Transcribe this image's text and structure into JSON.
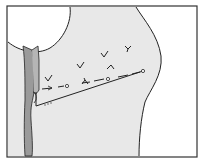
{
  "diagram": {
    "type": "anatomical-illustration",
    "colors": {
      "background": "#ffffff",
      "tissue_fill": "#e8e8e8",
      "band_fill": "#9a9a9a",
      "outline": "#222222",
      "frame": "#333333"
    },
    "markers": {
      "dashed_path_points": [
        [
          40,
          88
        ],
        [
          67,
          86
        ],
        [
          108,
          79
        ],
        [
          143,
          71
        ]
      ],
      "knot_circles": [
        [
          67,
          86
        ],
        [
          108,
          79
        ],
        [
          143,
          71
        ]
      ],
      "check_marks": [
        [
          47,
          80
        ],
        [
          79,
          66
        ],
        [
          104,
          55
        ],
        [
          127,
          49
        ],
        [
          110,
          69
        ],
        [
          85,
          82
        ]
      ],
      "suture_line": [
        [
          36,
          106
        ],
        [
          143,
          71
        ]
      ]
    },
    "labels": []
  }
}
